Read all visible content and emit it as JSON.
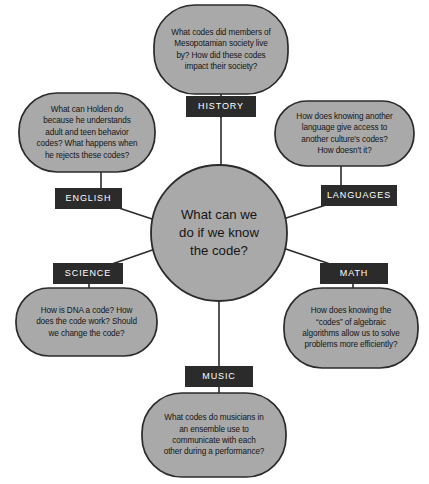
{
  "diagram": {
    "type": "concept-map",
    "title": "What can we do if we know the code?",
    "colors": {
      "bubble_fill": "#a9a9a9",
      "bubble_stroke": "#2b2b2b",
      "label_box_fill": "#2b2b2b",
      "label_text": "#ffffff",
      "bubble_text": "#151515",
      "connector": "#2b2b2b",
      "background": "#ffffff"
    },
    "center": {
      "text": "What can we\ndo if we know\nthe code?"
    },
    "branches": [
      {
        "id": "history",
        "label": "HISTORY",
        "question": "What codes did members of\nMesopotamian society live\nby? How did these codes\nimpact their society?"
      },
      {
        "id": "languages",
        "label": "LANGUAGES",
        "question": "How does knowing another\nlanguage give access to\nanother culture's codes?\nHow doesn't it?"
      },
      {
        "id": "math",
        "label": "MATH",
        "question": "How does knowing the\n“codes” of algebraic\nalgorithms allow us to solve\nproblems more efficiently?"
      },
      {
        "id": "music",
        "label": "MUSIC",
        "question": "What codes do musicians in\nan ensemble use to\ncommunicate with each\nother during a performance?"
      },
      {
        "id": "science",
        "label": "SCIENCE",
        "question": "How is DNA a code? How\ndoes the code work? Should\nwe change the code?"
      },
      {
        "id": "english",
        "label": "ENGLISH",
        "question": "What can Holden do\nbecause he understands\nadult and teen behavior\ncodes? What happens when\nhe rejects these codes?"
      }
    ]
  }
}
